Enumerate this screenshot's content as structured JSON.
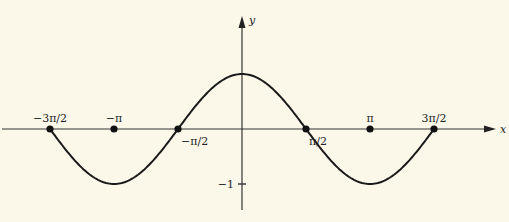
{
  "chart_data": {
    "type": "line",
    "title": "",
    "function": "y = cos(x)",
    "xlabel": "x",
    "ylabel": "y",
    "xlim": [
      -3.77,
      4.0
    ],
    "ylim": [
      -1.6,
      1.2
    ],
    "x_domain": [
      -4.712389,
      4.712389
    ],
    "x_ticks": [
      {
        "value": -4.712389,
        "label": "−3π/2",
        "label_pos": "above"
      },
      {
        "value": -3.141593,
        "label": "−π",
        "label_pos": "above"
      },
      {
        "value": -1.570796,
        "label": "−π/2",
        "label_pos": "below"
      },
      {
        "value": 1.570796,
        "label": "π/2",
        "label_pos": "below"
      },
      {
        "value": 3.141593,
        "label": "π",
        "label_pos": "above"
      },
      {
        "value": 4.712389,
        "label": "3π/2",
        "label_pos": "above"
      }
    ],
    "y_ticks": [
      {
        "value": -1,
        "label": "−1"
      }
    ],
    "marked_points": [
      -4.712389,
      -3.141593,
      -1.570796,
      1.570796,
      3.141593,
      4.712389
    ],
    "grid": false,
    "legend": "none",
    "colors": {
      "curve": "#1a1a1a",
      "axis": "#333333",
      "background": "#fbf8ea"
    }
  }
}
